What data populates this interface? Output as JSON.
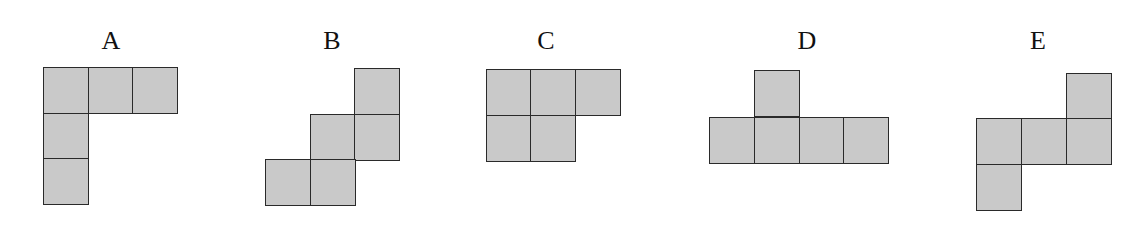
{
  "figure": {
    "colors": {
      "fill": "#c9c9c9",
      "border": "#2a2a2a",
      "label": "#111111",
      "background": "#ffffff"
    },
    "shapes": [
      {
        "label": "A",
        "square_count": 5,
        "layout": "three squares across top row, two more below the leftmost square"
      },
      {
        "label": "B",
        "square_count": 5,
        "layout": "staircase: one square top-right, two in middle row, two in bottom-left"
      },
      {
        "label": "C",
        "square_count": 5,
        "layout": "three squares across top row, two below the left two"
      },
      {
        "label": "D",
        "square_count": 5,
        "layout": "four squares in a row with one square above the second"
      },
      {
        "label": "E",
        "square_count": 5,
        "layout": "three squares in middle row, one above the right, one below the left"
      }
    ]
  }
}
